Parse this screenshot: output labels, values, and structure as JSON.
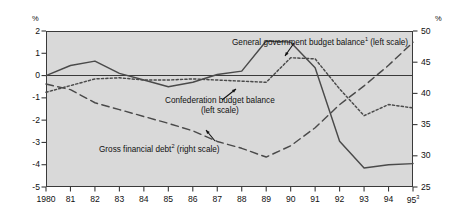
{
  "chart_data": {
    "type": "line",
    "title": "",
    "subtitle": "",
    "xlabel": "",
    "ylabel": "%",
    "ylabel_right": "%",
    "grid": false,
    "legend_position": "inline-annotations",
    "x": [
      "1980",
      "81",
      "82",
      "83",
      "84",
      "85",
      "86",
      "87",
      "88",
      "89",
      "90",
      "91",
      "92",
      "93",
      "94",
      "95"
    ],
    "xtick_labels": [
      "1980",
      "81",
      "82",
      "83",
      "84",
      "85",
      "86",
      "87",
      "88",
      "89",
      "90",
      "91",
      "92",
      "93",
      "94",
      "95"
    ],
    "xtick_last_superscript": "3",
    "ylim": [
      -5,
      2
    ],
    "ytick_labels": [
      "2",
      "1",
      "0",
      "-1",
      "-2",
      "-3",
      "-4",
      "-5"
    ],
    "ytick_values": [
      2,
      1,
      0,
      -1,
      -2,
      -3,
      -4,
      -5
    ],
    "ylim_right": [
      25,
      50
    ],
    "ytick_labels_right": [
      "50",
      "45",
      "40",
      "35",
      "30",
      "25"
    ],
    "ytick_values_right": [
      50,
      45,
      40,
      35,
      30,
      25
    ],
    "zero_line_value": 0,
    "series": [
      {
        "name": "General government budget balance",
        "label": "General government budget balance",
        "label_superscript": "1",
        "scale": "left",
        "scale_note": "(left scale)",
        "style": "solid",
        "color": "#4a4a4a",
        "values": [
          0.0,
          0.45,
          0.65,
          0.1,
          -0.2,
          -0.5,
          -0.3,
          0.05,
          0.2,
          1.55,
          1.5,
          0.35,
          -2.95,
          -4.15,
          -4.0,
          -3.95
        ]
      },
      {
        "name": "Confederation budget balance",
        "label": "Confederation budget balance",
        "label_superscript": "",
        "scale": "left",
        "scale_note": "(left scale)",
        "style": "dotted",
        "color": "#4a4a4a",
        "values": [
          -0.75,
          -0.45,
          -0.15,
          -0.1,
          -0.2,
          -0.2,
          -0.15,
          -0.2,
          -0.25,
          -0.3,
          0.8,
          0.75,
          -0.6,
          -1.8,
          -1.3,
          -1.45
        ]
      },
      {
        "name": "Gross financial debt",
        "label": "Gross financial debt",
        "label_superscript": "2",
        "scale": "right",
        "scale_note": "(right scale)",
        "style": "dashed",
        "color": "#4a4a4a",
        "values": [
          41.5,
          40.6,
          38.5,
          37.4,
          36.3,
          35.2,
          34.0,
          32.3,
          31.2,
          29.8,
          31.6,
          34.5,
          38.2,
          41.2,
          44.5,
          48.2
        ]
      }
    ],
    "annotations": [
      {
        "id": "general-government-annotation",
        "text": "General government budget balance",
        "superscript": "1",
        "suffix": " (left scale)",
        "x": 232,
        "y": 38
      },
      {
        "id": "confederation-annotation",
        "line1": "Confederation budget balance",
        "line2": "(left scale)",
        "x": 165,
        "y": 98
      },
      {
        "id": "gross-financial-debt-annotation",
        "text": "Gross financial debt",
        "superscript": "2",
        "suffix": " (right scale)",
        "x": 99,
        "y": 144
      }
    ],
    "colors": {
      "plot_background": "#d9d9d9",
      "page_background": "#ffffff",
      "line": "#4a4a4a",
      "axis": "#3a3a3a",
      "text": "#111111"
    }
  }
}
